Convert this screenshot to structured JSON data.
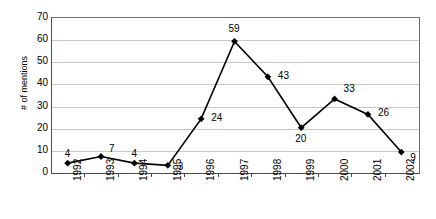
{
  "chart_data": {
    "type": "line",
    "title": "",
    "xlabel": "",
    "ylabel": "# of mentions",
    "categories": [
      "1992",
      "1993",
      "1994",
      "1995",
      "1996",
      "1997",
      "1998",
      "1999",
      "2000",
      "2001",
      "2002"
    ],
    "values": [
      4,
      7,
      4,
      3,
      24,
      59,
      43,
      20,
      33,
      26,
      9
    ],
    "ylim": [
      0,
      70
    ],
    "ytick_labels": [
      "0",
      "10",
      "20",
      "30",
      "40",
      "50",
      "60",
      "70"
    ],
    "ytick_values": [
      0,
      10,
      20,
      30,
      40,
      50,
      60,
      70
    ],
    "grid": true,
    "legend": "none",
    "marker": "diamond",
    "series_color": "#000000",
    "grid_color": "#c8c8c8",
    "axis_color": "#4a4a4a",
    "background": "#ffffff",
    "data_labels": [
      "4",
      "7",
      "4",
      "3",
      "24",
      "59",
      "43",
      "20",
      "33",
      "26",
      "9"
    ]
  }
}
